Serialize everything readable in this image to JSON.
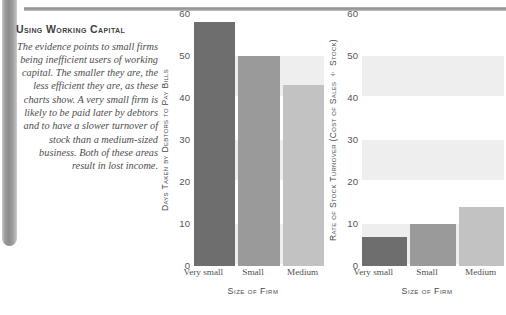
{
  "article": {
    "heading": "Using Working Capital",
    "body": "The evidence points to small firms being inefficient users of working capital. The smaller they are, the less efficient they are, as these charts show. A very small firm is likely to be paid later by debtors and to have a slower turnover of stock than a medium-sized business. Both of these areas result in lost income."
  },
  "palette": {
    "bar_very_small": "#6e6e6e",
    "bar_small": "#9a9a9a",
    "bar_medium": "#c2c2c2",
    "band": "#eeeeee",
    "rule": "#8f8f8f",
    "binding": "#9d9d9d"
  },
  "chart_data": [
    {
      "id": "days-taken",
      "type": "bar",
      "title": "",
      "xlabel": "Size of Firm",
      "ylabel": "Days Taken by Debtors to Pay Bills",
      "categories": [
        "Very small",
        "Small",
        "Medium"
      ],
      "values": [
        58,
        50,
        43
      ],
      "ylim": [
        0,
        60
      ],
      "yticks": [
        0,
        10,
        20,
        30,
        40,
        50,
        60
      ],
      "yticklabels": [
        "0",
        "10",
        "20",
        "30",
        "40",
        "50",
        "60"
      ],
      "grid": "horizontal-bands",
      "legend": "none",
      "bar_colors": [
        "#6e6e6e",
        "#9a9a9a",
        "#c2c2c2"
      ]
    },
    {
      "id": "stock-turnover",
      "type": "bar",
      "title": "",
      "xlabel": "Size of Firm",
      "ylabel": "Rate of Stock Turnover (Cost of Sales ÷ Stock)",
      "categories": [
        "Very small",
        "Small",
        "Medium"
      ],
      "values": [
        7,
        10,
        14
      ],
      "ylim": [
        0,
        60
      ],
      "yticks": [
        0,
        10,
        20,
        30,
        40,
        50,
        60
      ],
      "yticklabels": [
        "0",
        "10",
        "20",
        "30",
        "40",
        "50",
        "60"
      ],
      "grid": "horizontal-bands",
      "legend": "none",
      "bar_colors": [
        "#6e6e6e",
        "#9a9a9a",
        "#c2c2c2"
      ]
    }
  ]
}
